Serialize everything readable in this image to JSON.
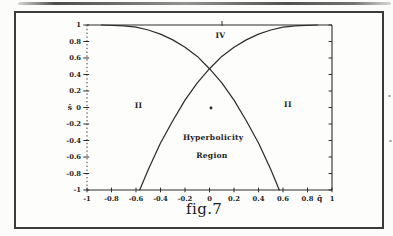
{
  "figure": {
    "caption": "fig.7"
  },
  "chart_data": {
    "type": "line",
    "title": "fig.7",
    "xlabel": "q̂",
    "ylabel": "ŝ",
    "xlim": [
      -1,
      1
    ],
    "ylim": [
      -1,
      1
    ],
    "grid": false,
    "legend": false,
    "x_ticks": [
      -1,
      -0.8,
      -0.6,
      -0.4,
      -0.2,
      0,
      0.2,
      0.4,
      0.6,
      0.8,
      1
    ],
    "x_tick_labels": [
      "-1",
      "-0.8",
      "-0.6",
      "-0.4",
      "-0.2",
      "0",
      "0.2",
      "0.4",
      "0.6",
      "0.8",
      "1"
    ],
    "y_ticks": [
      1,
      0.8,
      0.6,
      0.4,
      0.2,
      0,
      -0.2,
      -0.4,
      -0.6,
      -0.8,
      -1
    ],
    "y_tick_labels": [
      "1",
      "0.8",
      "0.6",
      "0.4",
      "0.2",
      "0",
      "-0.2",
      "-0.4",
      "-0.6",
      "-0.8",
      "-1"
    ],
    "xlabel_position_q": 0.9,
    "series": [
      {
        "name": "boundary-descending",
        "points": [
          [
            -0.88,
            1
          ],
          [
            -0.7,
            0.99
          ],
          [
            -0.6,
            0.975
          ],
          [
            -0.5,
            0.94
          ],
          [
            -0.4,
            0.89
          ],
          [
            -0.3,
            0.82
          ],
          [
            -0.2,
            0.73
          ],
          [
            -0.1,
            0.62
          ],
          [
            0,
            0.47
          ],
          [
            0.1,
            0.3
          ],
          [
            0.2,
            0.09
          ],
          [
            0.3,
            -0.16
          ],
          [
            0.4,
            -0.43
          ],
          [
            0.5,
            -0.75
          ],
          [
            0.57,
            -1
          ]
        ]
      },
      {
        "name": "boundary-ascending",
        "points": [
          [
            -0.57,
            -1
          ],
          [
            -0.5,
            -0.75
          ],
          [
            -0.4,
            -0.43
          ],
          [
            -0.3,
            -0.16
          ],
          [
            -0.2,
            0.09
          ],
          [
            -0.1,
            0.3
          ],
          [
            0,
            0.47
          ],
          [
            0.1,
            0.62
          ],
          [
            0.2,
            0.73
          ],
          [
            0.3,
            0.82
          ],
          [
            0.4,
            0.89
          ],
          [
            0.5,
            0.94
          ],
          [
            0.6,
            0.975
          ],
          [
            0.7,
            0.99
          ],
          [
            0.88,
            1
          ]
        ]
      }
    ],
    "origin_marker": {
      "q": 0,
      "s": 0
    },
    "annotations": [
      {
        "text": "IV",
        "q": 0.09,
        "s": 0.87
      },
      {
        "text": "II",
        "q": -0.58,
        "s": 0.03
      },
      {
        "text": "II",
        "q": 0.64,
        "s": 0.04
      },
      {
        "text": "Hyperbolicity",
        "q": 0.03,
        "s": -0.36
      },
      {
        "text": "Region",
        "q": 0.02,
        "s": -0.58
      }
    ]
  }
}
